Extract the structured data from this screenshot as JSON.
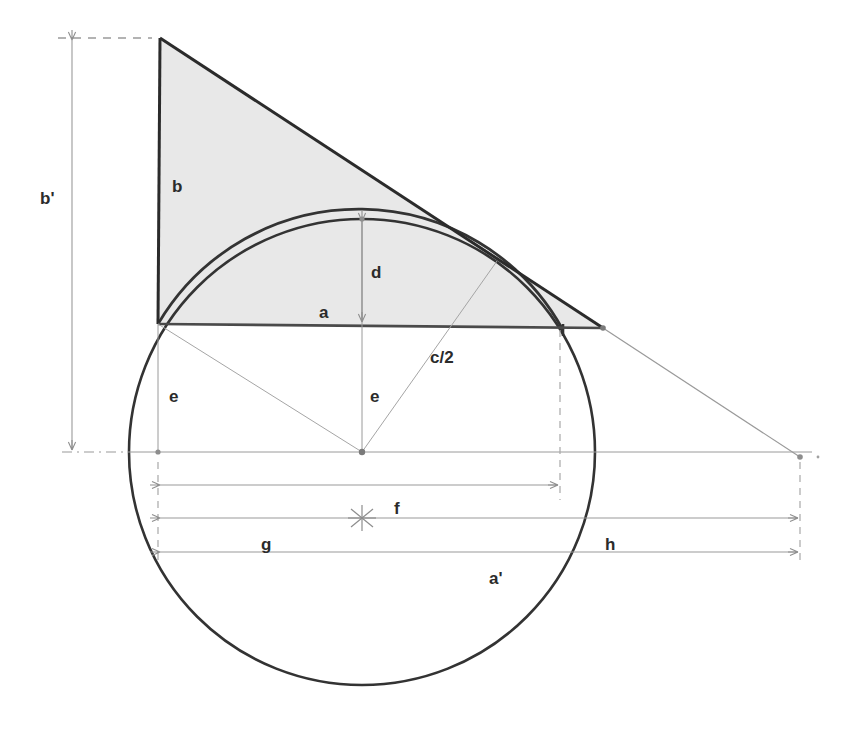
{
  "figure": {
    "background_color": "#ffffff",
    "stroke_dark": "#2f2f2f",
    "stroke_thin": "#8c8c8c",
    "stroke_dash": "#9a9a9a",
    "fill_shaded": "#e6e6e6"
  },
  "labels": {
    "b_prime": "b'",
    "b": "b",
    "d": "d",
    "a": "a",
    "c_half": "c/2",
    "e_left": "e",
    "e_center": "e",
    "f": "f",
    "g": "g",
    "h": "h",
    "a_prime": "a'"
  },
  "geometry": {
    "triangle": {
      "apex": [
        160,
        38
      ],
      "base_left": [
        158,
        324
      ],
      "base_right": [
        603,
        328
      ]
    },
    "circle": {
      "center": [
        362,
        452
      ],
      "radius": 233
    },
    "arc_top": [
      362,
      219
    ],
    "arc_chord_point": [
      495,
      262
    ],
    "baseline": {
      "y": 324,
      "x_left": 158,
      "x_right": 603
    },
    "center_axis": {
      "y": 452,
      "x_left": 60,
      "x_right": 812
    },
    "far_right_point": [
      800,
      458
    ],
    "dashed_vertical_x": 560
  },
  "dimensions": [
    {
      "name": "b_prime",
      "label": "b'",
      "orientation": "vertical",
      "x": 72,
      "y_from": 38,
      "y_to": 452
    },
    {
      "name": "f",
      "label": "f",
      "orientation": "horizontal",
      "y": 485,
      "x_from": 158,
      "x_to": 560
    },
    {
      "name": "g_h",
      "label_left": "g",
      "label_right": "h",
      "orientation": "horizontal",
      "y": 518,
      "x_from": 158,
      "x_to": 800,
      "tick_x": 362
    },
    {
      "name": "a_prime",
      "label": "a'",
      "orientation": "horizontal",
      "y": 552,
      "x_from": 158,
      "x_to": 800
    },
    {
      "name": "d",
      "label": "d",
      "orientation": "vertical",
      "x": 362,
      "y_from": 219,
      "y_to": 324
    }
  ],
  "label_positions": {
    "b_prime": [
      40,
      198
    ],
    "b": [
      172,
      192
    ],
    "d": [
      371,
      272
    ],
    "a": [
      319,
      314
    ],
    "c_half": [
      430,
      357
    ],
    "e_left": [
      169,
      396
    ],
    "e_center": [
      370,
      396
    ],
    "f": [
      394,
      508
    ],
    "g": [
      261,
      544
    ],
    "h": [
      605,
      544
    ],
    "a_prime": [
      489,
      578
    ]
  }
}
